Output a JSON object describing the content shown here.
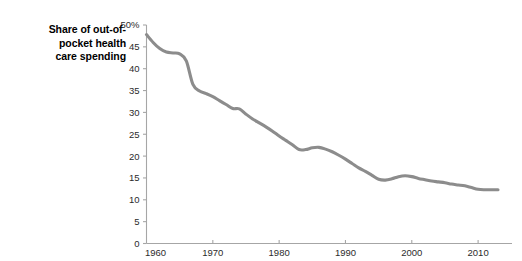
{
  "chart_data": {
    "type": "line",
    "title_lines": [
      "Share of out-of-",
      "pocket health",
      "care spending"
    ],
    "xlabel": "",
    "ylabel": "",
    "xlim": [
      1960,
      2013
    ],
    "ylim": [
      0,
      50
    ],
    "grid": false,
    "legend": "none",
    "line_color": "#8c8c8c",
    "axis_color": "#a6a6a6",
    "text_color": "#2b2b2b",
    "y_ticks": [
      0,
      5,
      10,
      15,
      20,
      25,
      30,
      35,
      40,
      45,
      50
    ],
    "y_tick_labels": [
      "0",
      "5",
      "10",
      "15",
      "20",
      "25",
      "30",
      "35",
      "40",
      "45",
      "50%"
    ],
    "x_ticks": [
      1960,
      1970,
      1980,
      1990,
      2000,
      2010
    ],
    "x_tick_labels": [
      "1960",
      "1970",
      "1980",
      "1990",
      "2000",
      "2010"
    ],
    "x": [
      1960,
      1961,
      1962,
      1963,
      1964,
      1965,
      1966,
      1967,
      1968,
      1969,
      1970,
      1971,
      1972,
      1973,
      1974,
      1975,
      1976,
      1977,
      1978,
      1979,
      1980,
      1981,
      1982,
      1983,
      1984,
      1985,
      1986,
      1987,
      1988,
      1989,
      1990,
      1991,
      1992,
      1993,
      1994,
      1995,
      1996,
      1997,
      1998,
      1999,
      2000,
      2001,
      2002,
      2003,
      2004,
      2005,
      2006,
      2007,
      2008,
      2009,
      2010,
      2011,
      2012,
      2013
    ],
    "values": [
      47.8,
      46.0,
      44.6,
      43.8,
      43.6,
      43.4,
      41.8,
      36.4,
      34.9,
      34.3,
      33.6,
      32.7,
      31.8,
      30.9,
      30.8,
      29.6,
      28.5,
      27.6,
      26.7,
      25.7,
      24.6,
      23.6,
      22.6,
      21.5,
      21.5,
      21.9,
      22.0,
      21.6,
      21.0,
      20.2,
      19.3,
      18.3,
      17.3,
      16.5,
      15.6,
      14.7,
      14.5,
      14.8,
      15.3,
      15.5,
      15.3,
      14.9,
      14.6,
      14.3,
      14.1,
      13.9,
      13.6,
      13.4,
      13.2,
      12.8,
      12.4,
      12.3,
      12.3,
      12.3
    ],
    "series": [
      {
        "name": "Share of out-of-pocket health care spending",
        "values": [
          47.8,
          46.0,
          44.6,
          43.8,
          43.6,
          43.4,
          41.8,
          36.4,
          34.9,
          34.3,
          33.6,
          32.7,
          31.8,
          30.9,
          30.8,
          29.6,
          28.5,
          27.6,
          26.7,
          25.7,
          24.6,
          23.6,
          22.6,
          21.5,
          21.5,
          21.9,
          22.0,
          21.6,
          21.0,
          20.2,
          19.3,
          18.3,
          17.3,
          16.5,
          15.6,
          14.7,
          14.5,
          14.8,
          15.3,
          15.5,
          15.3,
          14.9,
          14.6,
          14.3,
          14.1,
          13.9,
          13.6,
          13.4,
          13.2,
          12.8,
          12.4,
          12.3,
          12.3,
          12.3
        ]
      }
    ]
  }
}
